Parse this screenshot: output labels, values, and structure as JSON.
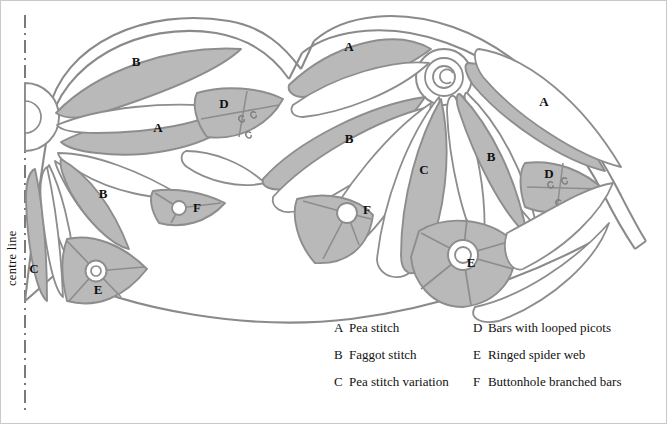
{
  "figure": {
    "title_text": "",
    "centre_line_label": "centre line",
    "fill_color": "#b9b9b9",
    "fill_color_dark": "#ababab",
    "stroke_color": "#8d8d8d",
    "outline_color": "#8a8a8a",
    "background": "#ffffff",
    "border_color": "#c9c9c9",
    "text_color": "#111111"
  },
  "region_labels": [
    {
      "letter": "B",
      "x": 135,
      "y": 62
    },
    {
      "letter": "A",
      "x": 157,
      "y": 128
    },
    {
      "letter": "D",
      "x": 223,
      "y": 104
    },
    {
      "letter": "B",
      "x": 102,
      "y": 194
    },
    {
      "letter": "F",
      "x": 196,
      "y": 208
    },
    {
      "letter": "C",
      "x": 33,
      "y": 269
    },
    {
      "letter": "E",
      "x": 97,
      "y": 290
    },
    {
      "letter": "A",
      "x": 348,
      "y": 47
    },
    {
      "letter": "B",
      "x": 348,
      "y": 139
    },
    {
      "letter": "C",
      "x": 423,
      "y": 170
    },
    {
      "letter": "F",
      "x": 366,
      "y": 210
    },
    {
      "letter": "A",
      "x": 543,
      "y": 102
    },
    {
      "letter": "B",
      "x": 490,
      "y": 157
    },
    {
      "letter": "D",
      "x": 548,
      "y": 174
    },
    {
      "letter": "E",
      "x": 470,
      "y": 263
    }
  ],
  "legend": {
    "rows": [
      {
        "key_left": "A",
        "text_left": "Pea stitch",
        "key_right": "D",
        "text_right": "Bars with looped picots"
      },
      {
        "key_left": "B",
        "text_left": "Faggot stitch",
        "key_right": "E",
        "text_right": "Ringed spider web"
      },
      {
        "key_left": "C",
        "text_left": "Pea stitch variation",
        "key_right": "F",
        "text_right": "Buttonhole branched bars"
      }
    ]
  },
  "icons": {
    "spider_web": "ringed-spider-web-icon",
    "branched_bars": "buttonhole-branched-bars-icon",
    "looped_picot": "looped-picot-icon",
    "spiral_rosette": "spiral-rosette-icon",
    "half_rosette": "half-rosette-icon",
    "centre_line": "centre-line-icon"
  }
}
